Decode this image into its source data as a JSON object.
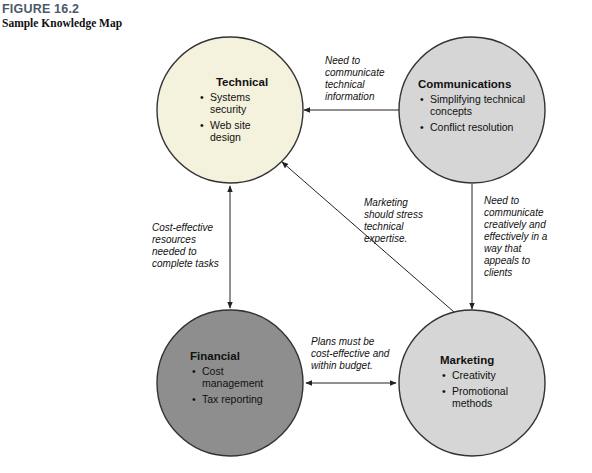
{
  "figure": {
    "number": "FIGURE 16.2",
    "title": "Sample Knowledge Map"
  },
  "nodes": {
    "technical": {
      "title": "Technical",
      "items": [
        "Systems security",
        "Web site design"
      ],
      "fill": "#f4f2dc"
    },
    "communications": {
      "title": "Communications",
      "items": [
        "Simplifying technical concepts",
        "Conflict resolution"
      ],
      "fill": "#d6d6d6"
    },
    "financial": {
      "title": "Financial",
      "items": [
        "Cost management",
        "Tax reporting"
      ],
      "fill": "#8e8e8e"
    },
    "marketing": {
      "title": "Marketing",
      "items": [
        "Creativity",
        "Promotional methods"
      ],
      "fill": "#d6d6d6"
    }
  },
  "edges": [
    {
      "from": "communications",
      "to": "technical",
      "label": "Need to communicate technical information"
    },
    {
      "from": "communications",
      "to": "marketing",
      "label": "Need to communicate creatively and effectively in a way that appeals to clients"
    },
    {
      "from": "marketing",
      "to": "technical",
      "label": "Marketing should stress technical expertise."
    },
    {
      "from": "technical",
      "to": "financial",
      "bidirectional": true,
      "label": "Cost-effective resources needed to complete tasks"
    },
    {
      "from": "financial",
      "to": "marketing",
      "bidirectional": true,
      "label": "Plans must be cost-effective and within budget."
    }
  ],
  "labels": {
    "comm_to_tech": [
      "Need to",
      "communicate",
      "technical",
      "information"
    ],
    "comm_to_mkt": [
      "Need to",
      "communicate",
      "creatively and",
      "effectively in a",
      "way that",
      "appeals to",
      "clients"
    ],
    "mkt_to_tech": [
      "Marketing",
      "should stress",
      "technical",
      "expertise."
    ],
    "tech_fin": [
      "Cost-effective",
      "resources",
      "needed to",
      "complete tasks"
    ],
    "fin_mkt": [
      "Plans must be",
      "cost-effective and",
      "within budget."
    ]
  }
}
